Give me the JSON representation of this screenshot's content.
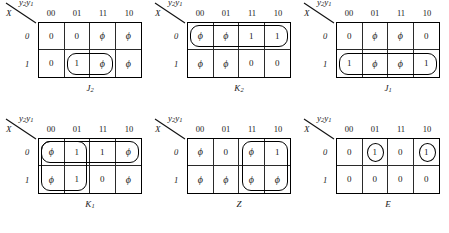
{
  "figure": {
    "axis_col_label_main": "y",
    "axis_col_label_sub1": "2",
    "axis_col_label_sub2": "1",
    "axis_row_label": "X",
    "col_headers": [
      "00",
      "01",
      "11",
      "10"
    ],
    "row_headers": [
      "0",
      "1"
    ]
  },
  "maps": [
    {
      "name": "J2",
      "caption_main": "J",
      "caption_sub": "2",
      "rows": [
        [
          "0",
          "0",
          "ϕ",
          "ϕ"
        ],
        [
          "0",
          "1",
          "ϕ",
          "ϕ"
        ]
      ],
      "loops": [
        {
          "shape": "rounded",
          "row": 1,
          "col": 1,
          "rowspan": 1,
          "colspan": 2
        }
      ]
    },
    {
      "name": "K2",
      "caption_main": "K",
      "caption_sub": "2",
      "rows": [
        [
          "ϕ",
          "ϕ",
          "1",
          "1"
        ],
        [
          "ϕ",
          "ϕ",
          "0",
          "0"
        ]
      ],
      "loops": [
        {
          "shape": "rounded",
          "row": 0,
          "col": 0,
          "rowspan": 1,
          "colspan": 4
        }
      ]
    },
    {
      "name": "J1",
      "caption_main": "J",
      "caption_sub": "1",
      "rows": [
        [
          "0",
          "ϕ",
          "ϕ",
          "0"
        ],
        [
          "1",
          "ϕ",
          "ϕ",
          "1"
        ]
      ],
      "loops": [
        {
          "shape": "rounded",
          "row": 1,
          "col": 0,
          "rowspan": 1,
          "colspan": 4
        }
      ]
    },
    {
      "name": "K1",
      "caption_main": "K",
      "caption_sub": "1",
      "rows": [
        [
          "ϕ",
          "1",
          "1",
          "ϕ"
        ],
        [
          "ϕ",
          "1",
          "0",
          "ϕ"
        ]
      ],
      "loops": [
        {
          "shape": "rounded",
          "row": 0,
          "col": 0,
          "rowspan": 1,
          "colspan": 4
        },
        {
          "shape": "rounded",
          "row": 0,
          "col": 0,
          "rowspan": 2,
          "colspan": 2
        }
      ]
    },
    {
      "name": "Z",
      "caption_main": "Z",
      "caption_sub": "",
      "rows": [
        [
          "ϕ",
          "0",
          "ϕ",
          "1"
        ],
        [
          "ϕ",
          "ϕ",
          "ϕ",
          "ϕ"
        ]
      ],
      "loops": [
        {
          "shape": "rounded",
          "row": 0,
          "col": 2,
          "rowspan": 2,
          "colspan": 2
        }
      ]
    },
    {
      "name": "E",
      "caption_main": "E",
      "caption_sub": "",
      "rows": [
        [
          "0",
          "1",
          "0",
          "1"
        ],
        [
          "0",
          "0",
          "0",
          "0"
        ]
      ],
      "loops": [
        {
          "shape": "circle",
          "row": 0,
          "col": 1,
          "rowspan": 1,
          "colspan": 1
        },
        {
          "shape": "circle",
          "row": 0,
          "col": 3,
          "rowspan": 1,
          "colspan": 1
        }
      ]
    }
  ]
}
